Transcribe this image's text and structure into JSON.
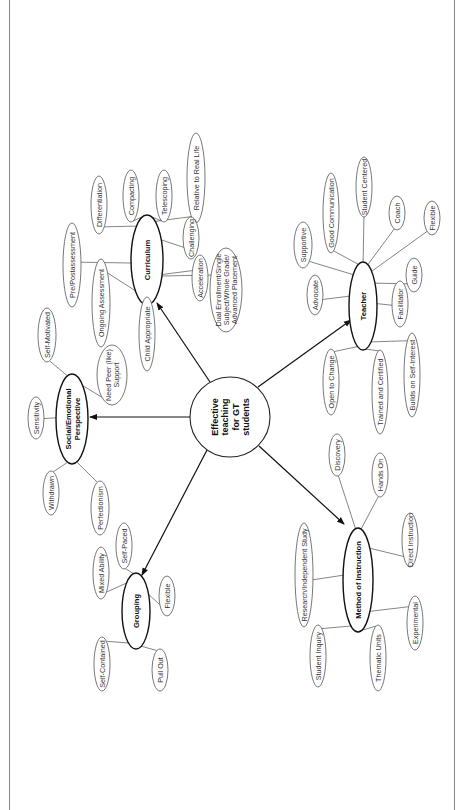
{
  "diagram": {
    "center": {
      "label_lines": [
        "Effective",
        "teaching",
        "for GT",
        "students"
      ]
    },
    "hubs": {
      "curriculum": {
        "label_lines": [
          "Curriculum"
        ],
        "leaves": [
          {
            "label_lines": [
              "Differentiation"
            ]
          },
          {
            "label_lines": [
              "Compacting"
            ]
          },
          {
            "label_lines": [
              "Telescoping"
            ]
          },
          {
            "label_lines": [
              "Relative to Real Life"
            ]
          },
          {
            "label_lines": [
              "Challenging"
            ]
          },
          {
            "label_lines": [
              "Pre/Postassessment"
            ]
          },
          {
            "label_lines": [
              "Ongoing Assessment"
            ]
          },
          {
            "label_lines": [
              "Acceleration"
            ]
          },
          {
            "label_lines": [
              "Dual Enrollment/Single",
              "Subject/Whole Grade/",
              "Advanced Placement"
            ]
          },
          {
            "label_lines": [
              "Child Appropriate"
            ]
          }
        ]
      },
      "social": {
        "label_lines": [
          "Social/Emotional",
          "Perspective"
        ],
        "leaves": [
          {
            "label_lines": [
              "Self-Motivated"
            ]
          },
          {
            "label_lines": [
              "Need Peer (like)",
              "Support"
            ]
          },
          {
            "label_lines": [
              "Sensitivity"
            ]
          },
          {
            "label_lines": [
              "Withdrawn"
            ]
          },
          {
            "label_lines": [
              "Perfectionism"
            ]
          }
        ]
      },
      "grouping": {
        "label_lines": [
          "Grouping"
        ],
        "leaves": [
          {
            "label_lines": [
              "Self-Paced"
            ]
          },
          {
            "label_lines": [
              "Mixed Ability"
            ]
          },
          {
            "label_lines": [
              "Flexible"
            ]
          },
          {
            "label_lines": [
              "Self-Contained"
            ]
          },
          {
            "label_lines": [
              "Pull Out"
            ]
          }
        ]
      },
      "teacher": {
        "label_lines": [
          "Teacher"
        ],
        "leaves": [
          {
            "label_lines": [
              "Supportive"
            ]
          },
          {
            "label_lines": [
              "Good Communication"
            ]
          },
          {
            "label_lines": [
              "Student Centered"
            ]
          },
          {
            "label_lines": [
              "Coach"
            ]
          },
          {
            "label_lines": [
              "Flexible"
            ]
          },
          {
            "label_lines": [
              "Guide"
            ]
          },
          {
            "label_lines": [
              "Facilitator"
            ]
          },
          {
            "label_lines": [
              "Advocate"
            ]
          },
          {
            "label_lines": [
              "Open to Change"
            ]
          },
          {
            "label_lines": [
              "Trained and Certified"
            ]
          },
          {
            "label_lines": [
              "Builds on Self-Interest"
            ]
          }
        ]
      },
      "method": {
        "label_lines": [
          "Method of Instruction"
        ],
        "leaves": [
          {
            "label_lines": [
              "Discovery"
            ]
          },
          {
            "label_lines": [
              "Hands On"
            ]
          },
          {
            "label_lines": [
              "Research/Independent Study"
            ]
          },
          {
            "label_lines": [
              "Direct Instruction"
            ]
          },
          {
            "label_lines": [
              "Experimental"
            ]
          },
          {
            "label_lines": [
              "Student Inquiry"
            ]
          },
          {
            "label_lines": [
              "Thematic Units"
            ]
          }
        ]
      }
    }
  }
}
